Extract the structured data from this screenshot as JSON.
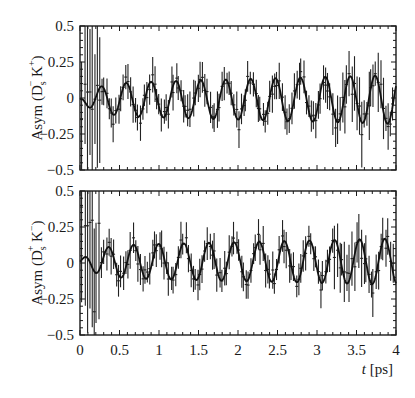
{
  "chart_data": [
    {
      "type": "scatter",
      "panel": "top",
      "ylabel": "Asym (D_s^- K^+)",
      "ylabel_parts": {
        "main": "Asym (D",
        "sub": "s",
        "sup1": "−",
        "mid": " K",
        "sup2": "+",
        "end": ")"
      },
      "xlabel": "",
      "xlim": [
        0,
        4
      ],
      "ylim": [
        -0.5,
        0.5
      ],
      "yticks": [
        0.5,
        0.25,
        0,
        -0.25,
        -0.5
      ],
      "ytick_labels": [
        "0.5",
        "0.25",
        "0",
        "−0.25",
        "−0.5"
      ],
      "fit_curve": {
        "description": "damped oscillation fit",
        "period_ps": 0.315,
        "first_peak_t": 0.27,
        "amplitude_start": 0.11,
        "amplitude_end": 0.17,
        "offset": -0.01
      },
      "points": {
        "n": 130,
        "t_range": [
          0.02,
          3.98
        ],
        "err_small": 0.07,
        "err_large": 0.5
      }
    },
    {
      "type": "scatter",
      "panel": "bottom",
      "ylabel": "Asym (D_s^+ K^-)",
      "ylabel_parts": {
        "main": "Asym (D",
        "sub": "s",
        "sup1": "+",
        "mid": " K",
        "sup2": "−",
        "end": ")"
      },
      "xlabel": "t [ps]",
      "xlim": [
        0,
        4
      ],
      "ylim": [
        -0.5,
        0.5
      ],
      "xticks": [
        0,
        0.5,
        1,
        1.5,
        2,
        2.5,
        3,
        3.5,
        4
      ],
      "xtick_labels": [
        "0",
        "0.5",
        "1",
        "1.5",
        "2",
        "2.5",
        "3",
        "3.5",
        "4"
      ],
      "yticks": [
        0.5,
        0.25,
        0,
        -0.25,
        -0.5
      ],
      "ytick_labels": [
        "0.5",
        "0.25",
        "0",
        "−0.25",
        "−0.5"
      ],
      "fit_curve": {
        "description": "damped oscillation fit",
        "period_ps": 0.318,
        "first_peak_t": 0.36,
        "amplitude_start": 0.11,
        "amplitude_end": 0.16,
        "offset": 0.01
      },
      "points": {
        "n": 130,
        "t_range": [
          0.02,
          3.98
        ],
        "err_small": 0.07,
        "err_large": 0.5
      }
    }
  ],
  "xaxis": {
    "label_t": "t",
    "label_unit": " [ps]"
  }
}
